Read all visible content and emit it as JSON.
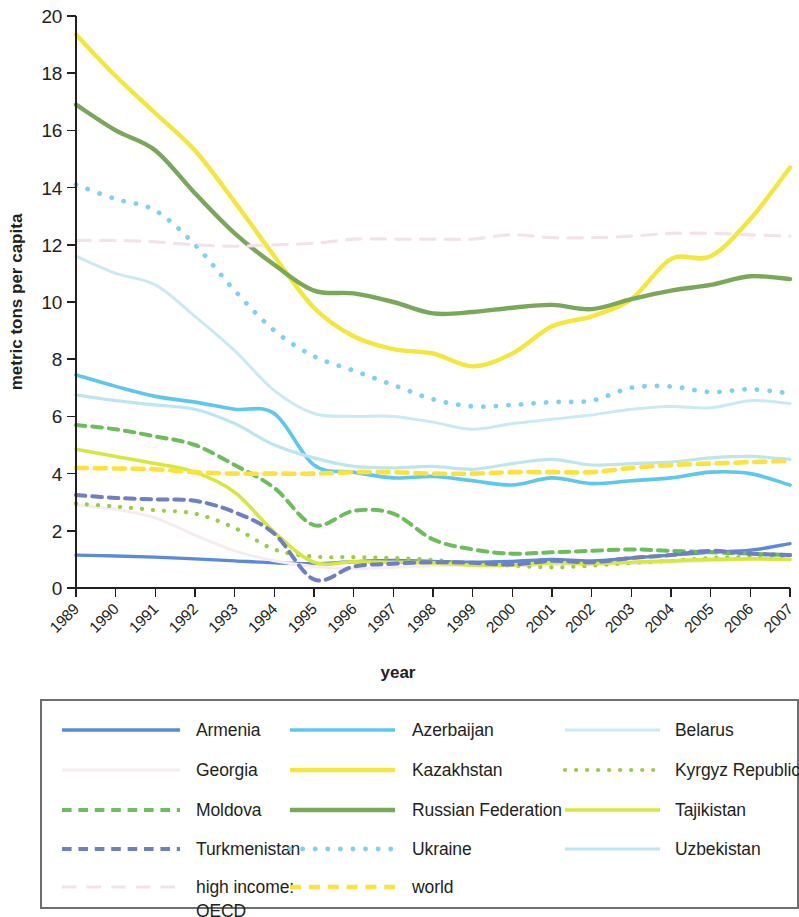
{
  "chart_data": {
    "type": "line",
    "title": "",
    "xlabel": "year",
    "ylabel": "metric tons per capita",
    "ylim": [
      0,
      20
    ],
    "yticks": [
      0,
      2,
      4,
      6,
      8,
      10,
      12,
      14,
      16,
      18,
      20
    ],
    "grid": false,
    "legend_position": "bottom",
    "x": [
      1989,
      1990,
      1991,
      1992,
      1993,
      1994,
      1995,
      1996,
      1997,
      1998,
      1999,
      2000,
      2001,
      2002,
      2003,
      2004,
      2005,
      2006,
      2007
    ],
    "categories": [
      "1989",
      "1990",
      "1991",
      "1992",
      "1993",
      "1994",
      "1995",
      "1996",
      "1997",
      "1998",
      "1999",
      "2000",
      "2001",
      "2002",
      "2003",
      "2004",
      "2005",
      "2006",
      "2007"
    ],
    "series": [
      {
        "name": "Armenia",
        "color": "#5b8bd8",
        "style": "solid",
        "width": 3.4,
        "values": [
          1.15,
          1.12,
          1.08,
          1.02,
          0.95,
          0.88,
          0.85,
          0.92,
          0.96,
          0.93,
          0.9,
          0.93,
          1.0,
          0.95,
          1.05,
          1.15,
          1.25,
          1.32,
          1.55
        ]
      },
      {
        "name": "Azerbaijan",
        "color": "#5bc8ec",
        "style": "solid",
        "width": 3.6,
        "values": [
          7.45,
          7.05,
          6.7,
          6.5,
          6.25,
          6.1,
          4.3,
          4.05,
          3.85,
          3.9,
          3.75,
          3.6,
          3.85,
          3.65,
          3.75,
          3.85,
          4.05,
          4.0,
          3.6
        ]
      },
      {
        "name": "Belarus",
        "color": "#c9e9f4",
        "style": "solid",
        "width": 3.0,
        "values": [
          11.6,
          11.0,
          10.6,
          9.5,
          8.3,
          6.9,
          6.1,
          6.0,
          6.0,
          5.8,
          5.55,
          5.75,
          5.9,
          6.05,
          6.25,
          6.35,
          6.3,
          6.55,
          6.45
        ]
      },
      {
        "name": "Georgia",
        "color": "#f6ecef",
        "style": "solid",
        "width": 3.0,
        "values": [
          2.9,
          2.75,
          2.45,
          1.85,
          1.3,
          0.95,
          0.75,
          0.68,
          0.72,
          0.78,
          0.8,
          0.78,
          0.8,
          0.82,
          0.85,
          0.9,
          0.95,
          1.05,
          1.1
        ]
      },
      {
        "name": "Kazakhstan",
        "color": "#f5e63c",
        "style": "solid",
        "width": 4.4,
        "values": [
          19.35,
          17.9,
          16.6,
          15.3,
          13.5,
          11.6,
          9.8,
          8.8,
          8.35,
          8.2,
          7.75,
          8.2,
          9.15,
          9.5,
          10.1,
          11.5,
          11.6,
          12.9,
          14.7
        ]
      },
      {
        "name": "Kyrgyz Republic",
        "color": "#9acd44",
        "style": "dotted",
        "width": 4.2,
        "values": [
          2.95,
          2.85,
          2.72,
          2.6,
          2.1,
          1.35,
          1.1,
          1.08,
          1.05,
          0.98,
          0.85,
          0.78,
          0.72,
          0.78,
          0.88,
          0.95,
          1.05,
          1.08,
          1.02
        ]
      },
      {
        "name": "Moldova",
        "color": "#6bbe5a",
        "style": "dashed",
        "width": 4.0,
        "values": [
          5.7,
          5.55,
          5.3,
          5.0,
          4.3,
          3.5,
          2.2,
          2.7,
          2.6,
          1.7,
          1.35,
          1.2,
          1.25,
          1.3,
          1.35,
          1.3,
          1.25,
          1.2,
          1.15
        ]
      },
      {
        "name": "Russian Federation",
        "color": "#7aa85a",
        "style": "solid",
        "width": 4.4,
        "values": [
          16.9,
          16.0,
          15.3,
          13.8,
          12.4,
          11.3,
          10.4,
          10.3,
          10.0,
          9.6,
          9.65,
          9.8,
          9.9,
          9.75,
          10.1,
          10.4,
          10.6,
          10.9,
          10.8
        ]
      },
      {
        "name": "Tajikistan",
        "color": "#d7e83c",
        "style": "solid",
        "width": 3.6,
        "values": [
          4.85,
          4.6,
          4.35,
          4.05,
          3.35,
          1.95,
          0.9,
          0.92,
          0.9,
          0.88,
          0.8,
          0.8,
          0.88,
          0.85,
          0.9,
          0.95,
          1.0,
          1.02,
          1.0
        ]
      },
      {
        "name": "Turkmenistan",
        "color": "#6f7fc4",
        "style": "dashed",
        "width": 4.0,
        "values": [
          3.25,
          3.15,
          3.1,
          3.05,
          2.65,
          1.9,
          0.3,
          0.75,
          0.85,
          0.9,
          0.88,
          0.82,
          0.95,
          0.9,
          1.05,
          1.15,
          1.3,
          1.2,
          1.15
        ]
      },
      {
        "name": "Ukraine",
        "color": "#7ed2ef",
        "style": "dotted",
        "width": 4.8,
        "values": [
          14.1,
          13.6,
          13.2,
          12.0,
          10.4,
          9.0,
          8.1,
          7.6,
          7.1,
          6.6,
          6.35,
          6.4,
          6.5,
          6.55,
          7.0,
          7.05,
          6.85,
          6.95,
          6.8
        ]
      },
      {
        "name": "Uzbekistan",
        "color": "#bde5f0",
        "style": "solid",
        "width": 3.2,
        "values": [
          6.75,
          6.55,
          6.4,
          6.25,
          5.75,
          5.0,
          4.55,
          4.25,
          4.2,
          4.25,
          4.15,
          4.35,
          4.5,
          4.3,
          4.35,
          4.4,
          4.55,
          4.6,
          4.5
        ]
      },
      {
        "name": "high income: OECD",
        "color": "#f3e2e8",
        "style": "longdash",
        "width": 3.2,
        "values": [
          12.15,
          12.15,
          12.1,
          12.0,
          11.95,
          12.0,
          12.05,
          12.2,
          12.2,
          12.2,
          12.2,
          12.35,
          12.25,
          12.25,
          12.3,
          12.4,
          12.4,
          12.35,
          12.3
        ]
      },
      {
        "name": "world",
        "color": "#fde23a",
        "style": "dashed",
        "width": 4.6,
        "values": [
          4.2,
          4.18,
          4.15,
          4.05,
          4.0,
          4.0,
          4.0,
          4.05,
          4.05,
          4.0,
          4.0,
          4.05,
          4.05,
          4.05,
          4.2,
          4.3,
          4.35,
          4.4,
          4.45
        ]
      }
    ],
    "legend": {
      "columns": 3,
      "entries": [
        {
          "label": "Armenia",
          "series": "Armenia",
          "col": 0,
          "row": 0
        },
        {
          "label": "Azerbaijan",
          "series": "Azerbaijan",
          "col": 1,
          "row": 0
        },
        {
          "label": "Belarus",
          "series": "Belarus",
          "col": 2,
          "row": 0
        },
        {
          "label": "Georgia",
          "series": "Georgia",
          "col": 0,
          "row": 1
        },
        {
          "label": "Kazakhstan",
          "series": "Kazakhstan",
          "col": 1,
          "row": 1
        },
        {
          "label": "Kyrgyz Republic",
          "series": "Kyrgyz Republic",
          "col": 2,
          "row": 1
        },
        {
          "label": "Moldova",
          "series": "Moldova",
          "col": 0,
          "row": 2
        },
        {
          "label": "Russian Federation",
          "series": "Russian Federation",
          "col": 1,
          "row": 2
        },
        {
          "label": "Tajikistan",
          "series": "Tajikistan",
          "col": 2,
          "row": 2
        },
        {
          "label": "Turkmenistan",
          "series": "Turkmenistan",
          "col": 0,
          "row": 3
        },
        {
          "label": "Ukraine",
          "series": "Ukraine",
          "col": 1,
          "row": 3
        },
        {
          "label": "Uzbekistan",
          "series": "Uzbekistan",
          "col": 2,
          "row": 3
        },
        {
          "label": "high income:\nOECD",
          "series": "high income: OECD",
          "col": 0,
          "row": 4
        },
        {
          "label": "world",
          "series": "world",
          "col": 1,
          "row": 4
        }
      ]
    }
  }
}
